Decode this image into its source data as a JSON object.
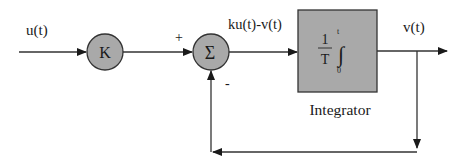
{
  "diagram": {
    "type": "block-diagram",
    "title": "",
    "signals": {
      "input": "u(t)",
      "error": "ku(t)-v(t)",
      "output": "v(t)"
    },
    "blocks": {
      "gain": {
        "symbol": "K",
        "shape": "circle"
      },
      "summer": {
        "symbol": "Σ",
        "shape": "circle",
        "plus_sign": "+",
        "minus_sign": "-"
      },
      "integrator": {
        "numerator": "1",
        "denominator": "T",
        "integral_symbol": "∫",
        "upper_limit": "t",
        "lower_limit": "0",
        "caption": "Integrator"
      }
    },
    "colors": {
      "block_fill": "#a9a9a9",
      "stroke": "#333333",
      "background": "#ffffff"
    }
  }
}
